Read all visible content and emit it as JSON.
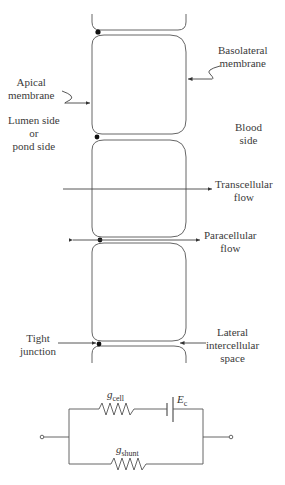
{
  "diagram": {
    "type": "epithelial-cell-layer-with-equivalent-circuit",
    "labels": {
      "basolateral_membrane": [
        "Basolateral",
        "membrane"
      ],
      "apical_membrane": [
        "Apical",
        "membrane"
      ],
      "lumen_side": [
        "Lumen side",
        "or",
        "pond side"
      ],
      "blood_side": [
        "Blood",
        "side"
      ],
      "transcellular_flow": [
        "Transcellular",
        "flow"
      ],
      "paracellular_flow": [
        "Paracellular",
        "flow"
      ],
      "tight_junction": [
        "Tight",
        "junction"
      ],
      "lateral_space": [
        "Lateral",
        "intercellular",
        "space"
      ]
    },
    "circuit": {
      "g_cell": {
        "symbol": "g",
        "subscript": "cell"
      },
      "e_c": {
        "symbol": "E",
        "subscript": "c"
      },
      "g_shunt": {
        "symbol": "g",
        "subscript": "shunt"
      }
    },
    "colors": {
      "line": "#555555",
      "junction": "#111111",
      "text": "#3a3a3a"
    }
  }
}
